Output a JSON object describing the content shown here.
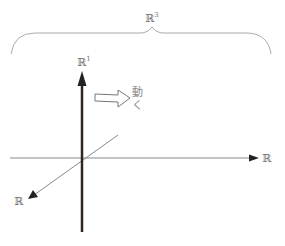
{
  "diagram": {
    "brace_label": {
      "base": "ℝ",
      "exp": "3"
    },
    "vertical_axis_label": {
      "base": "ℝ",
      "exp": "1"
    },
    "horizontal_axis_label": "ℝ",
    "diagonal_axis_label": "ℝ",
    "motion_text": {
      "line1": "動",
      "line2": "く"
    },
    "colors": {
      "brace": "#aaaaaa",
      "vertical_axis": "#2e2620",
      "thin_axes": "#888888",
      "arrow_head": "#222222",
      "hollow_arrow": "#777777"
    }
  }
}
